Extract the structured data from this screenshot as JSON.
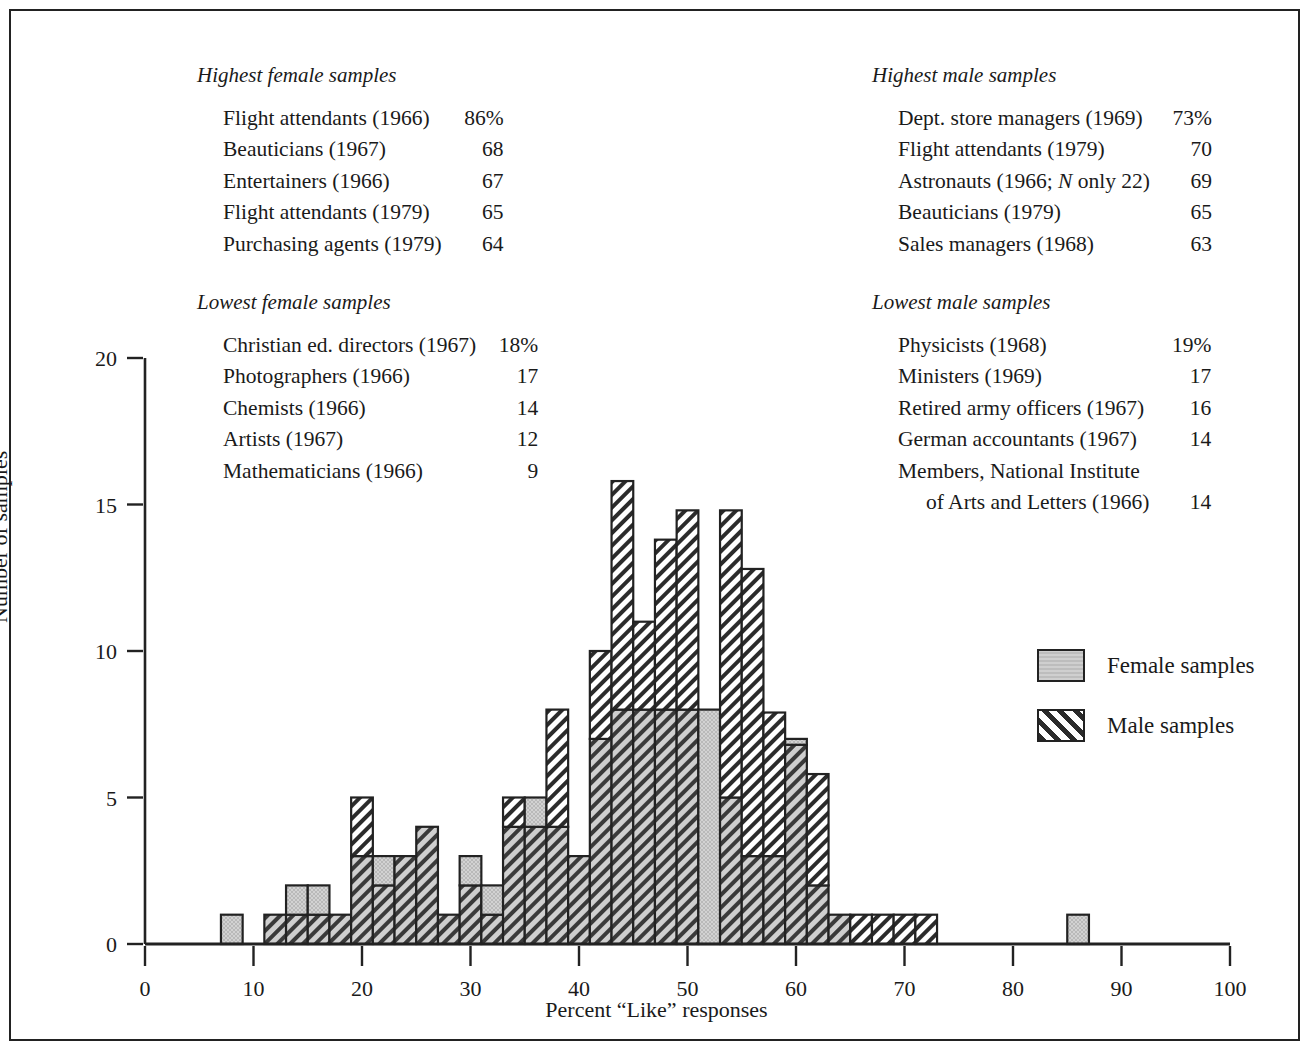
{
  "panels": {
    "highest_female": {
      "title": "Highest female samples",
      "rows": [
        {
          "label": "Flight attendants (1966)",
          "value": "86%"
        },
        {
          "label": "Beauticians (1967)",
          "value": "68"
        },
        {
          "label": "Entertainers (1966)",
          "value": "67"
        },
        {
          "label": "Flight attendants (1979)",
          "value": "65"
        },
        {
          "label": "Purchasing agents (1979)",
          "value": "64"
        }
      ]
    },
    "highest_male": {
      "title": "Highest male samples",
      "rows": [
        {
          "label": "Dept. store managers (1969)",
          "value": "73%"
        },
        {
          "label": "Flight attendants (1979)",
          "value": "70"
        },
        {
          "label": "Astronauts (1966; N only 22)",
          "value": "69"
        },
        {
          "label": "Beauticians (1979)",
          "value": "65"
        },
        {
          "label": "Sales managers (1968)",
          "value": "63"
        }
      ]
    },
    "lowest_female": {
      "title": "Lowest female samples",
      "rows": [
        {
          "label": "Christian ed. directors (1967)",
          "value": "18%"
        },
        {
          "label": "Photographers (1966)",
          "value": "17"
        },
        {
          "label": "Chemists (1966)",
          "value": "14"
        },
        {
          "label": "Artists (1967)",
          "value": "12"
        },
        {
          "label": "Mathematicians (1966)",
          "value": "9"
        }
      ]
    },
    "lowest_male": {
      "title": "Lowest male samples",
      "rows": [
        {
          "label": "Physicists (1968)",
          "value": "19%"
        },
        {
          "label": "Ministers (1969)",
          "value": "17"
        },
        {
          "label": "Retired army  officers (1967)",
          "value": "16"
        },
        {
          "label": "German accountants (1967)",
          "value": "14"
        },
        {
          "label": "Members, National Institute",
          "value": ""
        },
        {
          "label": "of Arts and Letters (1966)",
          "value": "14",
          "indent": true
        }
      ]
    }
  },
  "legend": {
    "female_label": "Female samples",
    "male_label": "Male samples"
  },
  "chart_data": {
    "type": "bar",
    "subtype": "overlaid-histogram",
    "title": "",
    "xlabel": "Percent “Like” responses",
    "ylabel": "Number of samples",
    "xlim": [
      0,
      100
    ],
    "ylim": [
      0,
      20
    ],
    "xticks": [
      0,
      10,
      20,
      30,
      40,
      50,
      60,
      70,
      80,
      90,
      100
    ],
    "yticks": [
      0,
      5,
      10,
      15,
      20
    ],
    "grid": false,
    "legend_position": "right-middle",
    "bin_width": 2,
    "bin_starts": [
      7,
      11,
      13,
      15,
      17,
      19,
      21,
      23,
      25,
      27,
      29,
      31,
      33,
      35,
      37,
      39,
      41,
      43,
      45,
      47,
      49,
      51,
      53,
      55,
      57,
      59,
      61,
      63,
      65,
      67,
      69,
      71,
      85
    ],
    "series": [
      {
        "name": "Female samples",
        "fill": "stipple-gray",
        "color": "#cfcfcf",
        "values": [
          1,
          1,
          2,
          2,
          1,
          3,
          3,
          3,
          4,
          1,
          3,
          2,
          4,
          5,
          4,
          3,
          7,
          8,
          8,
          8,
          8,
          8,
          5,
          3,
          3,
          7,
          2,
          1,
          0,
          0,
          0,
          0,
          1
        ]
      },
      {
        "name": "Male samples",
        "fill": "diagonal-hatch",
        "color": "#ffffff",
        "values": [
          0,
          1,
          1,
          1,
          1,
          5,
          2,
          3,
          4,
          1,
          2,
          1,
          5,
          4,
          8,
          3,
          10,
          15.8,
          11,
          13.8,
          14.8,
          0,
          14.8,
          12.8,
          7.9,
          6.8,
          5.8,
          1,
          1,
          1,
          1,
          1,
          0
        ]
      }
    ]
  }
}
